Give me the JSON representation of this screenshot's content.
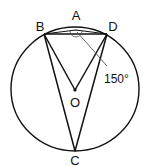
{
  "diagram": {
    "type": "circle-geometry",
    "points": {
      "A": "A",
      "B": "B",
      "C": "C",
      "D": "D",
      "O": "O"
    },
    "angle_label": "150°",
    "segments": [
      "BD",
      "BA",
      "AD",
      "BO",
      "DO",
      "BC",
      "DC"
    ]
  }
}
